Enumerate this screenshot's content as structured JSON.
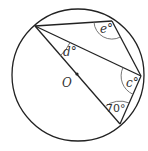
{
  "diagram": {
    "type": "circle-theorem",
    "colors": {
      "stroke": "#222222",
      "arc": "#666666",
      "text": "#333333",
      "background": "#ffffff"
    },
    "circle": {
      "cx": 78,
      "cy": 75,
      "r": 66
    },
    "center": {
      "label": "O",
      "x": 77,
      "y": 74
    },
    "points": {
      "A": {
        "x": 35,
        "y": 26
      },
      "B": {
        "x": 112,
        "y": 21
      },
      "C": {
        "x": 141,
        "y": 76
      },
      "D": {
        "x": 120,
        "y": 124
      }
    },
    "segments": [
      [
        "A",
        "B"
      ],
      [
        "B",
        "C"
      ],
      [
        "A",
        "C"
      ],
      [
        "A",
        "D"
      ],
      [
        "C",
        "D"
      ]
    ],
    "angles": [
      {
        "name": "e",
        "label": "e°",
        "vertex": "B"
      },
      {
        "name": "d",
        "label": "d°",
        "vertex": "A"
      },
      {
        "name": "c",
        "label": "c°",
        "vertex": "C"
      },
      {
        "name": "seventy",
        "label": "70°",
        "vertex": "D"
      }
    ],
    "labels": {
      "e": "e°",
      "d": "d°",
      "c": "c°",
      "seventy": "70°",
      "center": "O"
    }
  }
}
